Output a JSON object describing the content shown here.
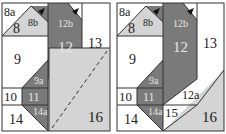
{
  "colors": {
    "dark": "#7a7a7a",
    "light": "#d4d4d4",
    "white": "#ffffff",
    "line": "#333333",
    "dark_text": "#e6e6e6",
    "light_text": "#222222"
  },
  "panels": [
    {
      "name": "left-block",
      "labels": {
        "p8a": "8a",
        "p8": "8",
        "p8b": "8b",
        "p12b": "12b",
        "p12": "12",
        "p13": "13",
        "p9": "9",
        "p9a": "9a",
        "p10": "10",
        "p11": "11",
        "p14a": "14a",
        "p14": "14",
        "p16": "16"
      },
      "dashed_diagonal": true
    },
    {
      "name": "right-block",
      "labels": {
        "p8a": "8a",
        "p8": "8",
        "p8b": "8b",
        "p12b": "12b",
        "p12": "12",
        "p13": "13",
        "p9": "9",
        "p9a": "9a",
        "p10": "10",
        "p11": "11",
        "p14a": "14a",
        "p14": "14",
        "p12a": "12a",
        "p15": "15",
        "p16": "16"
      },
      "dashed_diagonal": false
    }
  ]
}
